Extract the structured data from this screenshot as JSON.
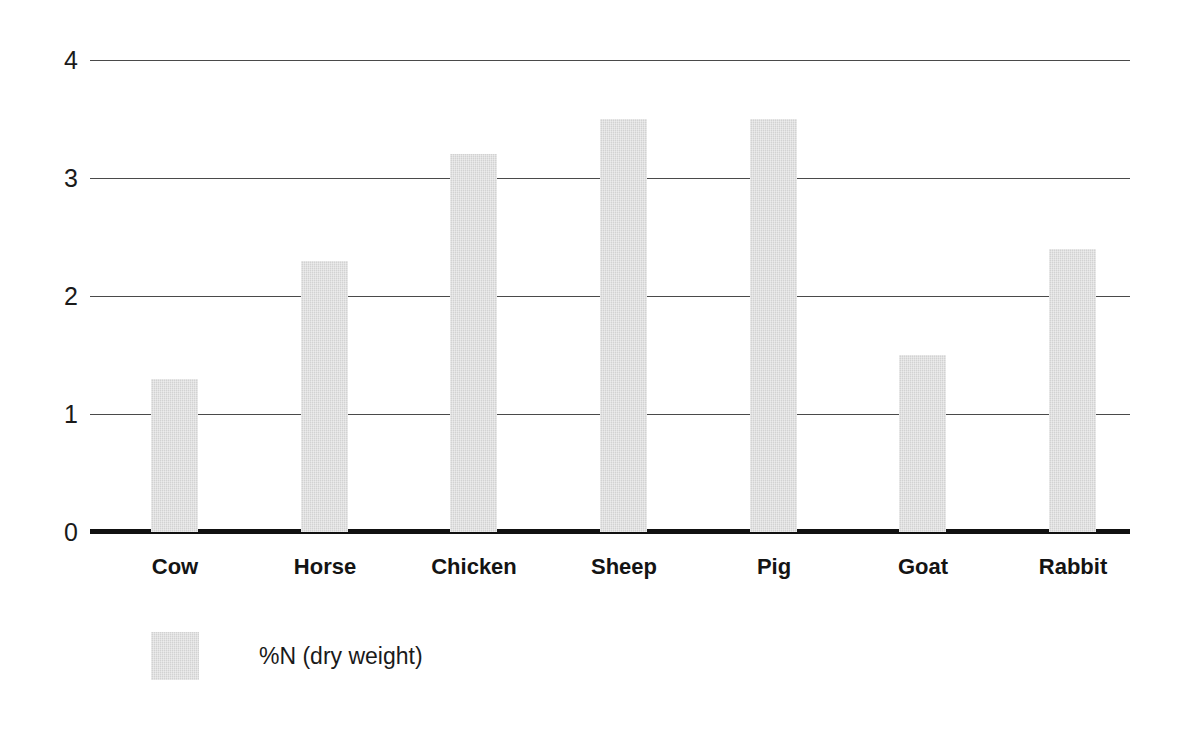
{
  "chart_data": {
    "type": "bar",
    "title": "",
    "subtitle": "",
    "xlabel": "",
    "ylabel": "",
    "categories": [
      "Cow",
      "Horse",
      "Chicken",
      "Sheep",
      "Pig",
      "Goat",
      "Rabbit"
    ],
    "series": [
      {
        "name": "%N (dry weight)",
        "values": [
          1.3,
          2.3,
          3.2,
          3.5,
          3.5,
          1.5,
          2.4
        ],
        "color": "#d2d2d2"
      }
    ],
    "ylim": [
      0,
      4
    ],
    "ytick_labels": [
      "4",
      "3",
      "2",
      "1",
      "0"
    ],
    "ytick_values": [
      4,
      3,
      2,
      1,
      0
    ],
    "gridlines": [
      1,
      2,
      3,
      4
    ],
    "grid": true,
    "grid_color": "#4a4a4a",
    "axis_color": "#111111",
    "legend": {
      "position": "bottom-left",
      "entries": [
        {
          "label": "%N (dry weight)",
          "color": "#d2d2d2"
        }
      ]
    },
    "annotations": []
  }
}
